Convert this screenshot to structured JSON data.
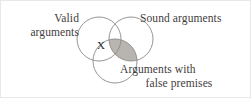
{
  "figure": {
    "type": "venn-diagram-3-set",
    "background_color": "#ffffff",
    "text_color": "#3f3d3c",
    "circle_stroke_color": "#8c8a88",
    "shade_fill_color": "#b8b4b0"
  },
  "labels": {
    "valid": {
      "line1": "Valid",
      "line2": "arguments"
    },
    "sound": {
      "line1": "Sound arguments"
    },
    "false_premises": {
      "line1": "Arguments with",
      "line2": "false premises"
    }
  },
  "marks": {
    "x_label": "X"
  },
  "sets": [
    {
      "name": "valid-arguments",
      "cx": 98,
      "cy": 38,
      "r": 22
    },
    {
      "name": "sound-arguments",
      "cx": 130,
      "cy": 38,
      "r": 22
    },
    {
      "name": "false-premises-arguments",
      "cx": 114,
      "cy": 60,
      "r": 22
    }
  ],
  "regions": [
    {
      "name": "sound-and-false-premises",
      "shaded": true,
      "description": "Shaded lens where Sound arguments overlaps Arguments with false premises"
    },
    {
      "name": "valid-and-false-premises",
      "shaded": false,
      "mark": "X",
      "description": "Region marked with X where Valid arguments overlaps Arguments with false premises"
    }
  ]
}
